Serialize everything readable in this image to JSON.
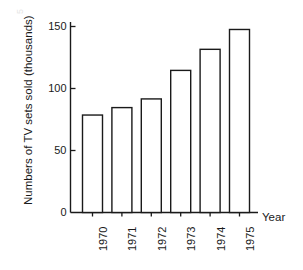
{
  "chart_data": {
    "type": "bar",
    "title": "",
    "subtitle": "",
    "xlabel": "Year",
    "ylabel": "Numbers of TV sets sold (thousands)",
    "categories": [
      "1970",
      "1971",
      "1972",
      "1973",
      "1974",
      "1975"
    ],
    "values": [
      79,
      85,
      92,
      115,
      132,
      148
    ],
    "ylim": [
      0,
      155
    ],
    "yticks": [
      0,
      50,
      100,
      150
    ],
    "ytick_labels": [
      "0",
      "50",
      "100",
      "150"
    ],
    "grid": false,
    "legend": false,
    "legend_position": "none",
    "bar_fill": "#ffffff",
    "bar_edge": "#1a1a1a",
    "axis_color": "#1a1a1a",
    "background": "#ffffff",
    "xtick_rotation": 90,
    "ylabel_rotation": 90,
    "annotations": []
  },
  "figure": {
    "faint_corner_text": "5"
  }
}
